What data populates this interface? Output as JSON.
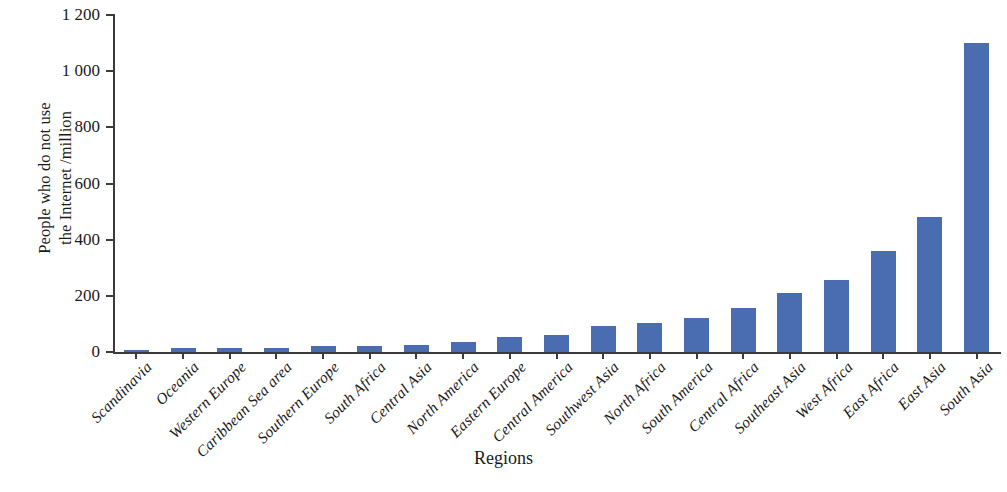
{
  "chart_data": {
    "type": "bar",
    "title": "",
    "xlabel": "Regions",
    "ylabel_lines": [
      "People who do not use",
      "the Internet /million"
    ],
    "ylabel": "People who do not use the Internet /million",
    "ylim": [
      0,
      1200
    ],
    "ytick_labels": [
      "0",
      "200",
      "400",
      "600",
      "800",
      "1 000",
      "1 200"
    ],
    "ytick_values": [
      0,
      200,
      400,
      600,
      800,
      1000,
      1200
    ],
    "grid": false,
    "legend": null,
    "bar_color": "#4a6cb0",
    "axis_color": "#3b3b3b",
    "categories": [
      "Scandinavia",
      "Oceania",
      "Western Europe",
      "Caribbean Sea area",
      "Southern Europe",
      "South Africa",
      "Central Asia",
      "North America",
      "Eastern Europe",
      "Central America",
      "Southwest Asia",
      "North Africa",
      "South America",
      "Central Africa",
      "Southeast Asia",
      "West Africa",
      "East Africa",
      "East Asia",
      "South Asia"
    ],
    "values": [
      4,
      13,
      14,
      15,
      20,
      23,
      25,
      35,
      52,
      62,
      93,
      103,
      120,
      155,
      210,
      255,
      360,
      480,
      1100
    ]
  }
}
